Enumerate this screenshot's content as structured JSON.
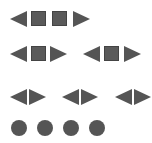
{
  "colors": {
    "shape": "#555555",
    "background": "#ffffff"
  },
  "rows": [
    {
      "name": "row-1",
      "items": [
        "triangle-left",
        "square",
        "square",
        "triangle-right"
      ]
    },
    {
      "name": "row-2",
      "groups": [
        [
          "triangle-left",
          "square",
          "triangle-right"
        ],
        [
          "triangle-left",
          "square",
          "triangle-right"
        ]
      ]
    },
    {
      "name": "row-3",
      "groups": [
        [
          "triangle-left",
          "triangle-right"
        ],
        [
          "triangle-left",
          "triangle-right"
        ],
        [
          "triangle-left",
          "triangle-right"
        ]
      ]
    },
    {
      "name": "row-4",
      "items": [
        "circle",
        "circle",
        "circle",
        "circle"
      ]
    }
  ]
}
